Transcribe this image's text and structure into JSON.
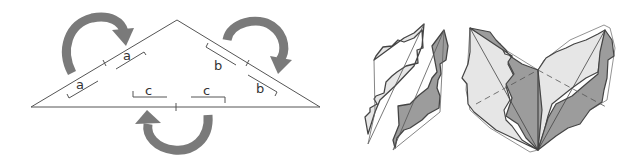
{
  "figure": {
    "colors": {
      "stroke": "#555555",
      "arrow_fill": "#7a7a7a",
      "light_fill": "#e6e6e6",
      "dark_fill": "#9c9c9c",
      "background": "#ffffff"
    },
    "triangle_panel": {
      "labels": {
        "left_upper": "a",
        "left_lower": "a",
        "right_upper": "b",
        "right_lower": "b",
        "bottom_left": "c",
        "bottom_right": "c"
      },
      "arrows": [
        "rotate-left-half",
        "rotate-right-half",
        "rotate-bottom-half"
      ]
    },
    "pieces_panel": {
      "description": "two separated irregular tiles (light and dark)"
    },
    "assembled_panel": {
      "description": "assembled butterfly-shaped tiling of light and dark tiles"
    }
  }
}
